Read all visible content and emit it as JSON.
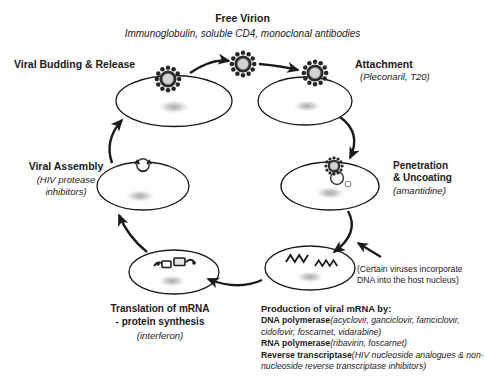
{
  "diagram": {
    "stroke_color": "#1a1a1a",
    "nucleus_color": "#b9b9b9",
    "virion_core_color": "#cfcfcf"
  },
  "free_virion": {
    "title": "Free Virion",
    "subtitle": "Immunoglobulin, soluble CD4, monoclonal antibodies"
  },
  "stages": {
    "budding": {
      "label": "Viral Budding & Release"
    },
    "attachment": {
      "label": "Attachment",
      "drugs": "(Pleconaril, T20)"
    },
    "penetration": {
      "label_line1": "Penetration",
      "label_line2": "& Uncoating",
      "drugs": "(amantidine)"
    },
    "assembly": {
      "label": "Viral Assembly",
      "drugs_line1": "(HIV protease",
      "drugs_line2": "inhibitors)"
    },
    "translation": {
      "label_line1": "Translation of mRNA",
      "label_line2": "- protein synthesis",
      "drugs": "(interferon)"
    }
  },
  "nucleus_note": {
    "line1": "(Certain viruses incorporate",
    "line2": "DNA into the host nucleus)"
  },
  "production": {
    "heading": "Production of viral mRNA by:",
    "enzymes": [
      {
        "name": "DNA polymerase",
        "drugs": "(acyclovir, ganciclovir, famciclovir, cidofovir, foscarnet, vidarabine)"
      },
      {
        "name": "RNA polymerase",
        "drugs": "(ribavirin, foscarnet)"
      },
      {
        "name": "Reverse transcriptase",
        "drugs": "(HIV nucleoside analogues & non-nucleoside reverse transcriptase inhibitors)"
      }
    ]
  }
}
